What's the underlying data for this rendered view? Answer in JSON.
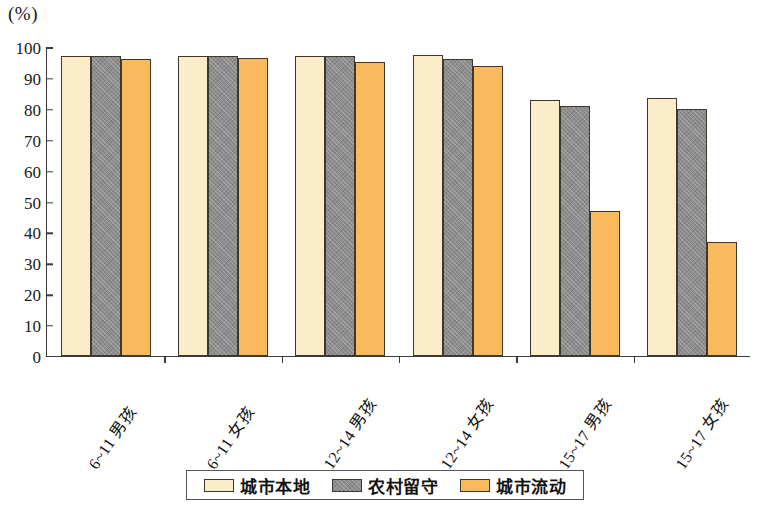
{
  "chart_data": {
    "type": "bar",
    "title": "",
    "subtitle": "",
    "unit_label": "(%)",
    "xlabel": "",
    "ylabel": "",
    "ylim": [
      0,
      100
    ],
    "ytick_step": 10,
    "yticks": [
      "100",
      "90",
      "80",
      "70",
      "60",
      "50",
      "40",
      "30",
      "20",
      "10",
      "0"
    ],
    "grid": false,
    "legend_position": "bottom",
    "categories": [
      "6~11 男孩",
      "6~11 女孩",
      "12~14 男孩",
      "12~14 女孩",
      "15~17 男孩",
      "15~17 女孩"
    ],
    "series": [
      {
        "name": "城市本地",
        "color": "#fbecca",
        "values": [
          97,
          97,
          97,
          97.5,
          83,
          83.5
        ]
      },
      {
        "name": "农村留守",
        "color": "#8d8d8d",
        "values": [
          97,
          97,
          97,
          96,
          81,
          80
        ]
      },
      {
        "name": "城市流动",
        "color": "#f8ba5c",
        "values": [
          96,
          96.5,
          95,
          94,
          47,
          37
        ]
      }
    ]
  },
  "legend": {
    "items": [
      {
        "label": "城市本地",
        "swatch": "cream-swatch"
      },
      {
        "label": "农村留守",
        "swatch": "gray-swatch"
      },
      {
        "label": "城市流动",
        "swatch": "orange-swatch"
      }
    ]
  },
  "colors": {
    "series_0": "#fbecca",
    "series_1": "#8d8d8d",
    "series_2": "#f8ba5c",
    "bar_outline": "#40372c",
    "axis": "#3a3a3a",
    "background": "#ffffff"
  }
}
